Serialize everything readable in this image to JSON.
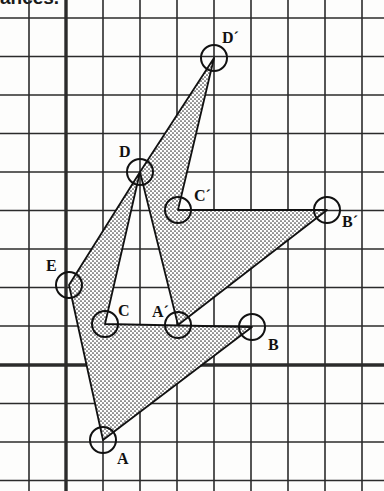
{
  "page": {
    "width": 384,
    "height": 491,
    "background_color": "#fdfdfc",
    "cut_off_heading": "ances."
  },
  "grid": {
    "line_color": "#2b2b2b",
    "thin_line_width": 1.6,
    "bold_line_width": 3.4,
    "cell_width": 37,
    "cell_height": 38.5,
    "x_lines": [
      29,
      66,
      103,
      140,
      177,
      214,
      251,
      288,
      325,
      362
    ],
    "y_lines": [
      18,
      56.5,
      95,
      133.5,
      172,
      210.5,
      249,
      287.5,
      326,
      365,
      403.5,
      442,
      480.5
    ],
    "bold_x_axis": 66,
    "bold_y_axis": 365
  },
  "figure": {
    "fill_pattern": "stipple-dots",
    "fill_dot_color": "#3a3a3a",
    "outline_color": "#111111",
    "outline_width": 1.8,
    "marker_radius": 13,
    "marker_stroke_width": 2.0,
    "marker_fill": "none",
    "points": [
      {
        "id": "A",
        "label": "A",
        "x": 103,
        "y": 440,
        "label_x": 117,
        "label_y": 451
      },
      {
        "id": "B",
        "label": "B",
        "x": 252,
        "y": 327,
        "label_x": 268,
        "label_y": 337
      },
      {
        "id": "C",
        "label": "C",
        "x": 105,
        "y": 324,
        "label_x": 118,
        "label_y": 303
      },
      {
        "id": "D",
        "label": "D",
        "x": 140,
        "y": 172,
        "label_x": 119,
        "label_y": 144
      },
      {
        "id": "E",
        "label": "E",
        "x": 69,
        "y": 285,
        "label_x": 46,
        "label_y": 258
      },
      {
        "id": "Ap",
        "label": "A´",
        "x": 178,
        "y": 325,
        "label_x": 152,
        "label_y": 304
      },
      {
        "id": "Bp",
        "label": "B´",
        "x": 327,
        "y": 210,
        "label_x": 342,
        "label_y": 214
      },
      {
        "id": "Cp",
        "label": "C´",
        "x": 178,
        "y": 210,
        "label_x": 194,
        "label_y": 188
      },
      {
        "id": "Dp",
        "label": "D´",
        "x": 214,
        "y": 58,
        "label_x": 222,
        "label_y": 30
      }
    ],
    "polygons": [
      {
        "id": "original",
        "name": "pentagon-ABCDE",
        "vertices": [
          "A",
          "B",
          "C",
          "D",
          "E"
        ],
        "filled": true
      },
      {
        "id": "image",
        "name": "pentagon-A-prime-B-prime-C-prime-D-prime",
        "vertices": [
          "Ap",
          "Bp",
          "Cp",
          "Dp",
          "D"
        ],
        "filled": true
      }
    ]
  }
}
